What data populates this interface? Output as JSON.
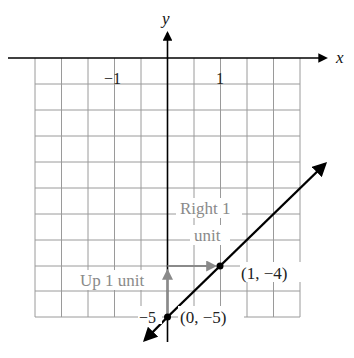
{
  "diagram": {
    "type": "coordinate-graph",
    "axes": {
      "x_label": "x",
      "y_label": "y",
      "x_ticks": [
        {
          "value": -1,
          "label": "−1"
        },
        {
          "value": 1,
          "label": "1"
        }
      ],
      "y_ticks": [
        {
          "value": -5,
          "label": "−5"
        }
      ]
    },
    "grid": {
      "x_range": [
        -2.5,
        2.5
      ],
      "y_range": [
        -5,
        0
      ],
      "squares_per_unit": 2
    },
    "line": {
      "equation": "y = x - 5",
      "slope": 1,
      "y_intercept": -5,
      "color": "#000000"
    },
    "points": [
      {
        "x": 0,
        "y": -5,
        "label": "(0, −5)"
      },
      {
        "x": 1,
        "y": -4,
        "label": "(1, −4)"
      }
    ],
    "annotations": {
      "up": {
        "text": "Up 1 unit",
        "color": "#8a8a8a"
      },
      "right_line1": "Right 1",
      "right_line2": "unit",
      "color": "#8a8a8a"
    }
  }
}
